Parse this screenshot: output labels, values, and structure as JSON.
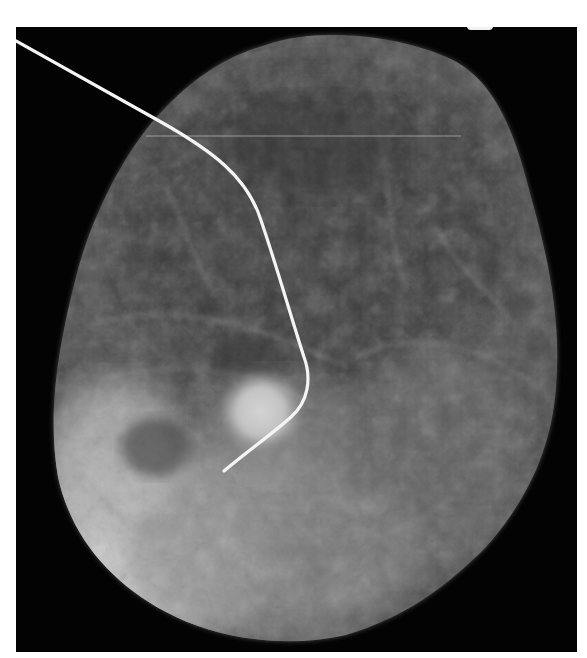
{
  "image": {
    "subject": "mammography specimen radiograph with localization hookwire",
    "background_color": "#030303",
    "page_color": "#ffffff",
    "tissue_color_range": [
      "#3a3a3a",
      "#d8d8d8"
    ],
    "wire_color": "#f4f4f4",
    "lesion_color": "#e0e0e0"
  }
}
